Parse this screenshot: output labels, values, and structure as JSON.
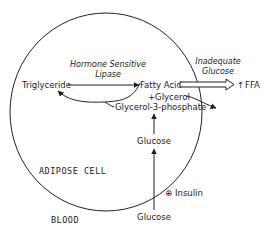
{
  "diagram": {
    "compartments": {
      "cell": "ADIPOSE CELL",
      "outside": "BLOOD"
    },
    "nodes": {
      "triglyceride": "Triglyceride",
      "fatty_acid": "Fatty Acid",
      "glycerol": "+Glycerol",
      "glycerol_3_phosphate": "Glycerol-3-phosphate",
      "glucose_cell": "Glucose",
      "glucose_blood": "Glucose",
      "ffa": "FFA"
    },
    "annotations": {
      "enzyme_line1": "Hormone Sensitive",
      "enzyme_line2": "Lipase",
      "condition_line1": "Inadequate",
      "condition_line2": "Glucose",
      "insulin": "Insulin",
      "insulin_sign": "⊕",
      "ffa_increase": "↑"
    },
    "colors": {
      "ink": "#222222",
      "background": "#ffffff"
    }
  }
}
